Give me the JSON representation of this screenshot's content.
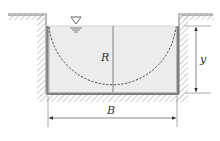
{
  "figure": {
    "type": "channel-cross-section",
    "labels": {
      "radius": "R",
      "depth": "y",
      "width": "B"
    },
    "symbols": {
      "free_surface": "free-surface-triangle-icon"
    },
    "colors": {
      "water": "#ececec",
      "wall": "#8a8a8a",
      "hatch": "#b5b5b5",
      "lines": "#555555",
      "dashed_semicircle": "#444444"
    }
  }
}
